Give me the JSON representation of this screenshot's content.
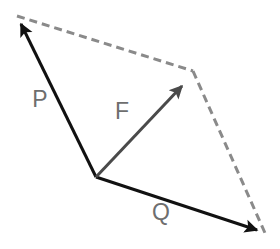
{
  "diagram": {
    "background_color": "#ffffff",
    "width": 280,
    "height": 249,
    "colors": {
      "solid_black": "#111111",
      "resultant_gray": "#4a4a4a",
      "dashed_gray": "#8a8a8a",
      "label_gray": "#6e6e6e"
    },
    "origin": {
      "x": 96,
      "y": 177
    },
    "vectors": [
      {
        "name": "P",
        "label": "P",
        "label_x": 40,
        "label_y": 101,
        "color": "#111111",
        "style": "solid",
        "from_x": 96,
        "from_y": 177,
        "to_x": 17,
        "to_y": 16,
        "arrowhead": true,
        "stroke_width": 3
      },
      {
        "name": "Q",
        "label": "Q",
        "label_x": 161,
        "label_y": 214,
        "color": "#111111",
        "style": "solid",
        "from_x": 96,
        "from_y": 177,
        "to_x": 265,
        "to_y": 233,
        "arrowhead": true,
        "stroke_width": 3
      },
      {
        "name": "F",
        "label": "F",
        "label_x": 122,
        "label_y": 113,
        "color": "#4a4a4a",
        "style": "solid",
        "from_x": 96,
        "from_y": 177,
        "to_x": 189,
        "to_y": 78,
        "arrowhead": true,
        "stroke_width": 3
      }
    ],
    "construction_lines": [
      {
        "name": "dashed-p-to-resultant",
        "color": "#8a8a8a",
        "style": "dashed",
        "dash_pattern": "8 5",
        "from_x": 17,
        "from_y": 16,
        "to_x": 193,
        "to_y": 71,
        "stroke_width": 3
      },
      {
        "name": "dashed-q-to-resultant",
        "color": "#8a8a8a",
        "style": "dashed",
        "dash_pattern": "8 5",
        "from_x": 193,
        "from_y": 71,
        "to_x": 265,
        "to_y": 233,
        "stroke_width": 3
      }
    ],
    "labels": {
      "p": "P",
      "q": "Q",
      "f": "F"
    }
  }
}
